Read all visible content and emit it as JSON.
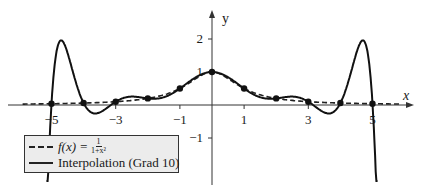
{
  "chart_data": {
    "type": "line",
    "title": "",
    "xlabel": "x",
    "ylabel": "y",
    "xlim": [
      -6.3,
      6.2
    ],
    "ylim": [
      -2.0,
      2.7
    ],
    "grid": false,
    "x_ticks": [
      -5,
      -3,
      -1,
      1,
      3,
      5
    ],
    "x_tick_labels": [
      "−5",
      "−3",
      "−1",
      "1",
      "3",
      "5"
    ],
    "y_ticks": [
      -1,
      1,
      2
    ],
    "y_tick_labels": [
      "−1",
      "1",
      "2"
    ],
    "legend_position": "lower-left",
    "series": [
      {
        "name": "f(x) = 1/(1+x²)",
        "style": "dashed",
        "function": "1/(1+x^2)",
        "x": [
          -5.8,
          -5,
          -4,
          -3,
          -2,
          -1,
          0,
          1,
          2,
          3,
          4,
          5,
          5.8
        ],
        "y": [
          0.029,
          0.038,
          0.059,
          0.1,
          0.2,
          0.5,
          1.0,
          0.5,
          0.2,
          0.1,
          0.059,
          0.038,
          0.029
        ]
      },
      {
        "name": "Interpolation (Grad 10)",
        "style": "solid",
        "x": [
          -5.15,
          -5,
          -4.8,
          -4.5,
          -4.2,
          -4,
          -3.6,
          -3,
          -2.5,
          -2,
          -1.5,
          -1,
          -0.5,
          0,
          0.5,
          1,
          1.5,
          2,
          2.5,
          3,
          3.6,
          4,
          4.2,
          4.5,
          4.8,
          5,
          5.15
        ],
        "y": [
          -1.7,
          0.038,
          1.5,
          1.92,
          1.0,
          0.059,
          -0.27,
          0.1,
          0.25,
          0.2,
          0.25,
          0.5,
          0.84,
          1.0,
          0.84,
          0.5,
          0.25,
          0.2,
          0.25,
          0.1,
          -0.27,
          0.059,
          1.0,
          1.92,
          1.5,
          0.038,
          -1.7
        ]
      }
    ],
    "interpolation_nodes": {
      "x": [
        -5,
        -4,
        -3,
        -2,
        -1,
        0,
        1,
        2,
        3,
        4,
        5
      ],
      "y": [
        0.038,
        0.059,
        0.1,
        0.2,
        0.5,
        1.0,
        0.5,
        0.2,
        0.1,
        0.059,
        0.038
      ]
    }
  },
  "legend": {
    "dashed_label_prefix": "f(x) =",
    "dashed_frac_num": "1",
    "dashed_frac_den": "1+x²",
    "solid_label": "Interpolation (Grad 10)"
  },
  "axes": {
    "x_name": "x",
    "y_name": "y"
  }
}
